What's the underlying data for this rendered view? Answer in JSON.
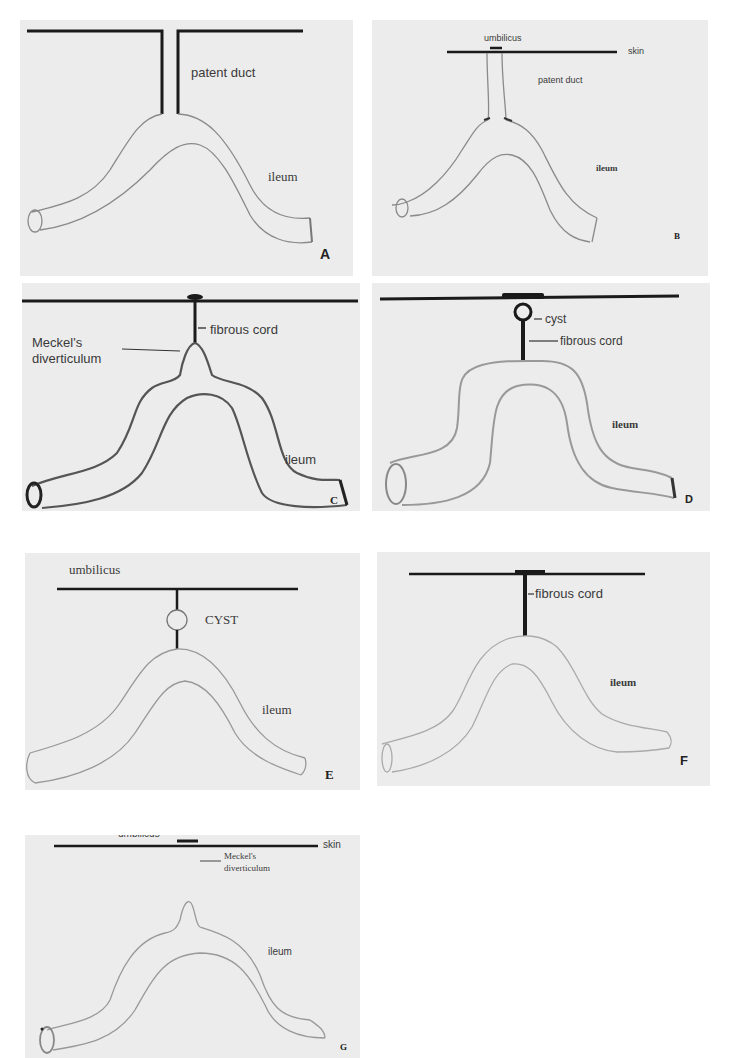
{
  "figure": {
    "panels": [
      {
        "id": "A",
        "letter": "A",
        "labels": {
          "duct": "patent duct",
          "ileum": "ileum"
        }
      },
      {
        "id": "B",
        "letter": "B",
        "labels": {
          "umbilicus": "umbilicus",
          "skin": "skin",
          "duct": "patent duct",
          "ileum": "ileum"
        }
      },
      {
        "id": "C",
        "letter": "C",
        "labels": {
          "cord": "fibrous cord",
          "diverticulum_line1": "Meckel's",
          "diverticulum_line2": "diverticulum",
          "ileum": "ileum"
        }
      },
      {
        "id": "D",
        "letter": "D",
        "labels": {
          "cyst": "cyst",
          "cord": "fibrous cord",
          "ileum": "ileum"
        }
      },
      {
        "id": "E",
        "letter": "E",
        "labels": {
          "umbilicus": "umbilicus",
          "cyst": "CYST",
          "ileum": "ileum"
        }
      },
      {
        "id": "F",
        "letter": "F",
        "labels": {
          "cord": "fibrous cord",
          "ileum": "ileum"
        }
      },
      {
        "id": "G",
        "letter": "G",
        "labels": {
          "umbilicus": "umbilicus",
          "skin": "skin",
          "diverticulum_line1": "Meckel's",
          "diverticulum_line2": "diverticulum",
          "ileum": "ileum"
        }
      }
    ]
  }
}
